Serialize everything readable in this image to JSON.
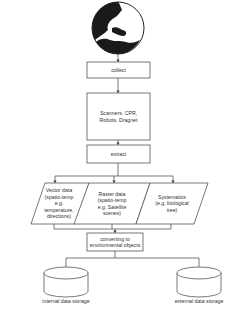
{
  "diagram": {
    "globe": {
      "label": "globe-earth"
    },
    "nodes": [
      {
        "id": "collect",
        "label": "collect"
      },
      {
        "id": "sources",
        "label": "Scanners, CPR,\nRobots, Dragnet"
      },
      {
        "id": "extract",
        "label": "extract"
      },
      {
        "id": "vector",
        "label": "Vector data\n(spatio-temp\ne.g.\ntemperature,\ndirections)"
      },
      {
        "id": "raster",
        "label": "Raster data\n(spatio-temp\ne.g. Satellite\nscenes)"
      },
      {
        "id": "systematics",
        "label": "Systematics\n(e.g. biological\ntree)"
      },
      {
        "id": "convert",
        "label": "converting to\nenvironmental objects"
      },
      {
        "id": "internal",
        "label": "internal data storage"
      },
      {
        "id": "external",
        "label": "external data storage"
      }
    ],
    "edges": [
      [
        "globe",
        "collect"
      ],
      [
        "collect",
        "sources"
      ],
      [
        "sources",
        "extract"
      ],
      [
        "extract",
        "vector"
      ],
      [
        "extract",
        "raster"
      ],
      [
        "extract",
        "systematics"
      ],
      [
        "vector",
        "convert"
      ],
      [
        "raster",
        "convert"
      ],
      [
        "systematics",
        "convert"
      ],
      [
        "convert",
        "internal"
      ],
      [
        "convert",
        "external"
      ]
    ],
    "colors": {
      "stroke": "#555555",
      "fill": "#ffffff",
      "globe_dark": "#1a1a1a"
    }
  }
}
